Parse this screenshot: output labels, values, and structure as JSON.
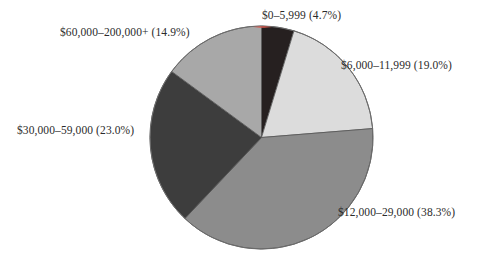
{
  "chart_data": {
    "type": "pie",
    "title": "",
    "subtitle": "",
    "xlabel": "",
    "ylabel": "",
    "legend_position": "none",
    "grid": false,
    "label_format": "{category} ({value}%)",
    "start_angle_deg": 0,
    "direction": "clockwise",
    "categories": [
      "$0–5,999",
      "$6,000–11,999",
      "$12,000–29,000",
      "$30,000–59,000",
      "$60,000–200,000+"
    ],
    "values": [
      4.7,
      19.0,
      38.3,
      23.0,
      14.9
    ],
    "value_unit": "%",
    "slice_colors": [
      "#262020",
      "#dcdcdc",
      "#8c8c8c",
      "#3d3d3d",
      "#a8a8a8"
    ],
    "slice_edge_color": "#555555",
    "labels": [
      "$0–5,999 (4.7%)",
      "$6,000–11,999 (19.0%)",
      "$12,000–29,000 (38.3%)",
      "$30,000–59,000 (23.0%)",
      "$60,000–200,000+ (14.9%)"
    ]
  },
  "figure": {
    "background_color": "#ffffff",
    "text_color": "#2b2b2b",
    "center_x": 261.5,
    "center_y": 137.5,
    "radius": 111.5
  }
}
